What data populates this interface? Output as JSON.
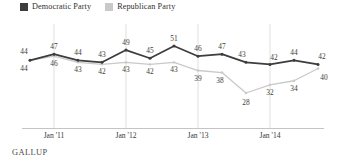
{
  "legend": {
    "position": "top-left",
    "items": [
      {
        "label": "Democratic Party",
        "color": "#3d3d3d",
        "icon": "square-swatch"
      },
      {
        "label": "Republican Party",
        "color": "#c9c9c9",
        "icon": "square-swatch"
      }
    ]
  },
  "footer": {
    "source": "GALLUP"
  },
  "chart_data": {
    "type": "line",
    "title": "",
    "subtitle": "",
    "xlabel": "",
    "ylabel": "",
    "ylim": [
      24,
      55
    ],
    "grid": "vertical-only",
    "legend_position": "top-left",
    "x": [
      0,
      1,
      2,
      3,
      4,
      5,
      6,
      7,
      8,
      9,
      10,
      11,
      12
    ],
    "tick_labels": [
      {
        "index": 1,
        "label": "Jan '11"
      },
      {
        "index": 4,
        "label": "Jan '12"
      },
      {
        "index": 7,
        "label": "Jan '13"
      },
      {
        "index": 10,
        "label": "Jan '14"
      }
    ],
    "series": [
      {
        "name": "Democratic Party",
        "color": "#3d3d3d",
        "values": [
          44,
          47,
          44,
          43,
          49,
          45,
          51,
          46,
          47,
          43,
          42,
          44,
          42
        ],
        "label_side": [
          "above",
          "above",
          "above",
          "above",
          "above",
          "above",
          "above",
          "above",
          "above",
          "above",
          "above",
          "above",
          "above"
        ]
      },
      {
        "name": "Republican Party",
        "color": "#c9c9c9",
        "values": [
          44,
          46,
          43,
          42,
          43,
          42,
          43,
          39,
          38,
          28,
          32,
          34,
          40
        ],
        "label_side": [
          "below",
          "below",
          "below",
          "below",
          "below",
          "below",
          "below",
          "below",
          "below",
          "below",
          "below",
          "below",
          "below"
        ]
      }
    ]
  }
}
